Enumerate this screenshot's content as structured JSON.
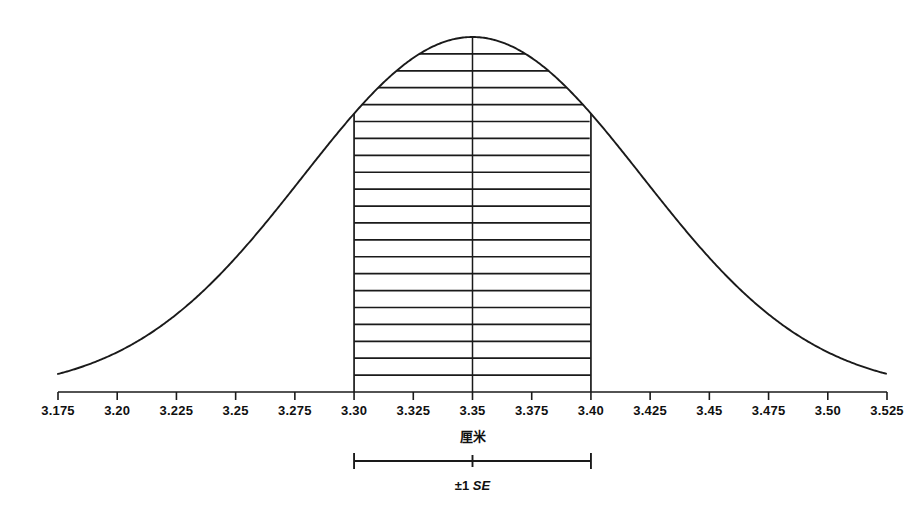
{
  "chart_data": {
    "type": "line",
    "title": "",
    "subtitle": "",
    "xlabel": "厘米",
    "ylabel": "",
    "grid": false,
    "legend": null,
    "distribution": {
      "shape": "normal",
      "mean": 3.35,
      "sigma": 0.0717,
      "peak_label": "3.35"
    },
    "xlim": [
      3.175,
      3.525
    ],
    "ylim": [
      0,
      1
    ],
    "tick_labels": [
      "3.175",
      "3.20",
      "3.225",
      "3.25",
      "3.275",
      "3.30",
      "3.325",
      "3.35",
      "3.375",
      "3.40",
      "3.425",
      "3.45",
      "3.475",
      "3.50",
      "3.525"
    ],
    "tick_values": [
      3.175,
      3.2,
      3.225,
      3.25,
      3.275,
      3.3,
      3.325,
      3.35,
      3.375,
      3.4,
      3.425,
      3.45,
      3.475,
      3.5,
      3.525
    ],
    "shaded_region": {
      "label": "±1 SE",
      "lower_bound": 3.3,
      "upper_bound": 3.4,
      "center": 3.35,
      "fill_style": "horizontal-hatch",
      "hatch_line_count": 21
    },
    "annotations": [
      {
        "name": "se-bracket",
        "text": "±1 SE",
        "from": 3.3,
        "to": 3.4,
        "center": 3.35
      },
      {
        "name": "center-line",
        "at": 3.35
      }
    ],
    "colors": {
      "curve": "#1a1a1a",
      "axis": "#1a1a1a",
      "hatch": "#1a1a1a",
      "background": "#ffffff"
    }
  },
  "axis": {
    "title": "厘米"
  },
  "error_bar": {
    "prefix": "±1",
    "statistic": "SE"
  }
}
